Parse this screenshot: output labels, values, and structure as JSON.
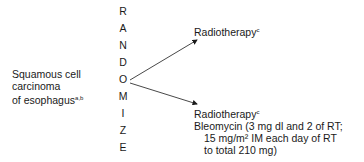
{
  "diagram": {
    "condition": {
      "lines": [
        "Squamous cell",
        "carcinoma",
        "of esophagus"
      ],
      "footnote": "a,b"
    },
    "randomize_letters": [
      "R",
      "A",
      "N",
      "D",
      "O",
      "M",
      "I",
      "Z",
      "E"
    ],
    "arm1": {
      "label": "Radiotherapy",
      "footnote": "c"
    },
    "arm2": {
      "label": "Radiotherapy",
      "footnote": "c",
      "lines": [
        "Bleomycin (3 mg dl and 2 of RT;",
        "15 mg/m² IM each day of RT",
        "to total 210 mg)"
      ]
    }
  }
}
